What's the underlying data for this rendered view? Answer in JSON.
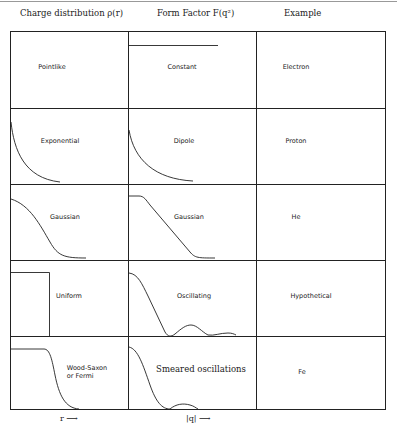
{
  "headers": {
    "charge_distribution": "Charge distribution ρ(r)",
    "form_factor": "Form Factor  F(q²)",
    "example": "Example"
  },
  "rows": [
    {
      "distribution": "Pointlike",
      "form_factor": "Constant",
      "example": "Electron"
    },
    {
      "distribution": "Exponential",
      "form_factor": "Dipole",
      "example": "Proton"
    },
    {
      "distribution": "Gaussian",
      "form_factor": "Gaussian",
      "example": "He"
    },
    {
      "distribution": "Uniform",
      "form_factor": "Oscillating",
      "example": "Hypothetical"
    },
    {
      "distribution": "Wood-Saxon\nor Fermi",
      "form_factor": "Smeared oscillations",
      "example": "Fe"
    }
  ],
  "axes": {
    "r_label": "r ⟶",
    "q_label": "|q| ⟶"
  }
}
